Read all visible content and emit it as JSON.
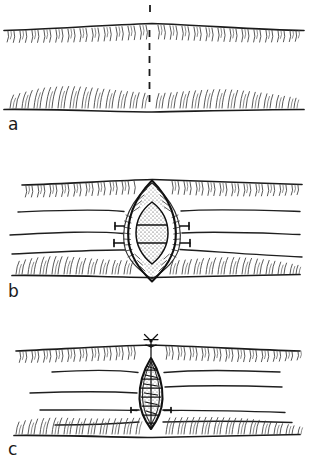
{
  "figure": {
    "background_color": "#ffffff",
    "ink_color": "#1b1b1b",
    "width": 309,
    "height": 467,
    "style": "pen-and-ink line drawing",
    "panels": [
      {
        "id": "a",
        "label": "a",
        "caption": "Planned vertical incision marked by dashed line across tissue layers",
        "elements": {
          "superficial_skin_line": "upper tissue boundary with downward hatching",
          "deep_skin_line": "lower tissue boundary with upward hatching",
          "incision_marker": "vertical dashed line",
          "marker_x": 150,
          "marker_top": 30,
          "marker_bottom": 108
        }
      },
      {
        "id": "b",
        "label": "b",
        "caption": "Incision opened; lens-shaped wound retracted exposing stippled deep tissue",
        "elements": {
          "wound_shape": "lens / ellipse",
          "wound_center_x": 152,
          "wound_center_y": 73,
          "wound_half_width": 27,
          "wound_half_height": 48,
          "inner_cavity": "stippled ellipse with two transverse bands",
          "retractors": 2,
          "tissue_planes": 4
        }
      },
      {
        "id": "c",
        "label": "c",
        "caption": "Wound closed with interrupted sutures; knot and thread tails at superior pole",
        "elements": {
          "wound_shape": "narrow closed ellipse",
          "wound_center_x": 151,
          "wound_center_y": 63,
          "wound_half_width": 13,
          "wound_half_height": 48,
          "suture_count": 6,
          "knot": "suture knot with two thread tails at top",
          "tissue_planes": 4
        }
      }
    ]
  }
}
